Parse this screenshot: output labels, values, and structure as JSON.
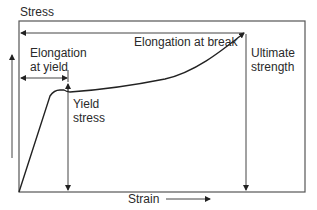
{
  "diagram": {
    "y_axis_label": "Stress",
    "x_axis_label": "Strain",
    "annotations": {
      "elongation_at_break": "Elongation at break",
      "elongation_at_yield_line1": "Elongation",
      "elongation_at_yield_line2": "at yield",
      "yield_stress_line1": "Yield",
      "yield_stress_line2": "stress",
      "ultimate_strength_line1": "Ultimate",
      "ultimate_strength_line2": "strength"
    },
    "colors": {
      "line": "#333333",
      "text": "#2a2a2a",
      "background": "#ffffff"
    }
  }
}
